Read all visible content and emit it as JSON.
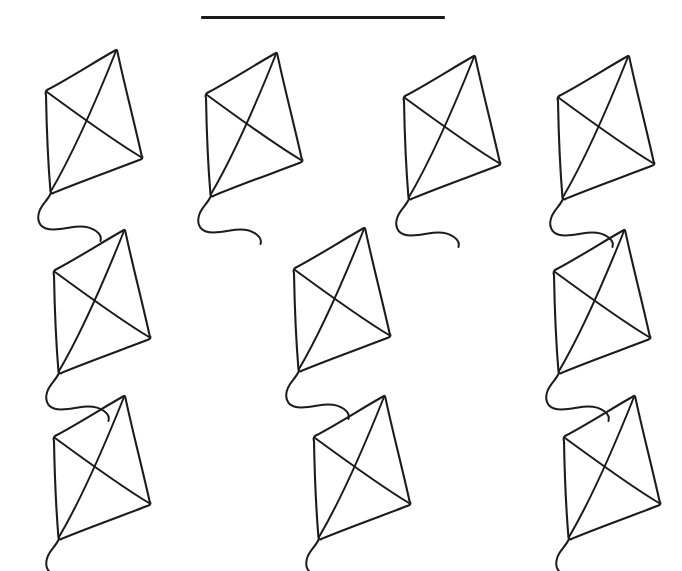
{
  "worksheet": {
    "type": "counting-worksheet",
    "background_color": "#ffffff",
    "ink_color": "#1c1c1c",
    "width": 682,
    "height": 571,
    "answer_blank": {
      "name": "answer-blank-line",
      "value": "",
      "x": 201,
      "y": 16,
      "width": 244,
      "height": 3,
      "color": "#1b1b1b"
    },
    "object_name": "kite",
    "object_count": 10,
    "rows": [
      {
        "row_label": "row-1",
        "count": 4,
        "items": [
          {
            "label": "kite-1",
            "x": 30,
            "y": 42
          },
          {
            "label": "kite-2",
            "x": 190,
            "y": 45
          },
          {
            "label": "kite-3",
            "x": 388,
            "y": 48
          },
          {
            "label": "kite-4",
            "x": 542,
            "y": 48
          }
        ]
      },
      {
        "row_label": "row-2",
        "count": 3,
        "items": [
          {
            "label": "kite-5",
            "x": 38,
            "y": 222
          },
          {
            "label": "kite-6",
            "x": 278,
            "y": 220
          },
          {
            "label": "kite-7",
            "x": 538,
            "y": 222
          }
        ]
      },
      {
        "row_label": "row-3",
        "count": 3,
        "items": [
          {
            "label": "kite-8",
            "x": 38,
            "y": 388
          },
          {
            "label": "kite-9",
            "x": 298,
            "y": 388
          },
          {
            "label": "kite-10",
            "x": 548,
            "y": 388
          }
        ]
      }
    ],
    "kite_geometry": {
      "description": "hand-drawn kite: quadrilateral sail with crossed spars and a wavy S-curve tail",
      "vertex_top": "86,8",
      "vertex_left": "16,49",
      "vertex_right": "112,116",
      "vertex_bottom": "20,150",
      "tail_description": "S-curve trailing down-left then sweeping right"
    }
  }
}
